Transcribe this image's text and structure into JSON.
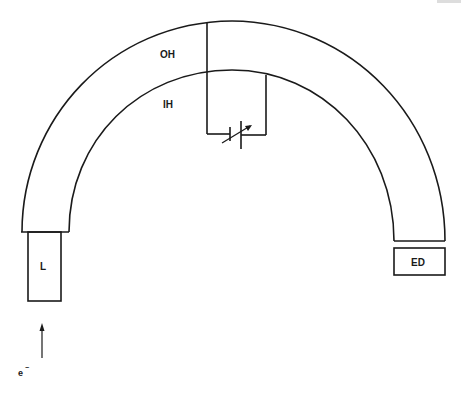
{
  "diagram": {
    "type": "hemispherical electron energy analyzer schematic",
    "labels": {
      "outer_hemisphere": "OH",
      "inner_hemisphere": "IH",
      "lens": "L",
      "electron_detector": "ED",
      "electron": "e",
      "electron_charge": "−"
    },
    "colors": {
      "stroke": "#1a1a1a",
      "background": "#ffffff"
    }
  }
}
